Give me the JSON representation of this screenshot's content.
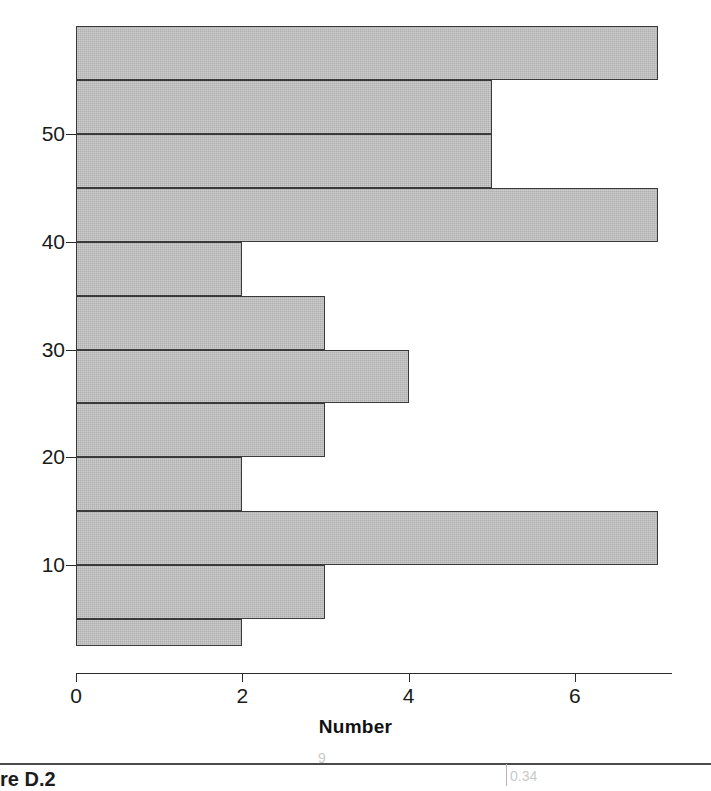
{
  "figure": {
    "caption": "re D.2",
    "bleed_marks": [
      "9",
      "0.34",
      "a"
    ]
  },
  "chart_data": {
    "type": "bar",
    "orientation": "horizontal",
    "title": "",
    "subtitle": "",
    "xlabel": "Number",
    "ylabel": "",
    "xlim": [
      0,
      7
    ],
    "ylim": [
      2.5,
      60
    ],
    "xticks": [
      0,
      2,
      4,
      6
    ],
    "xticklabels": [
      "0",
      "2",
      "4",
      "6"
    ],
    "yticks": [
      10,
      20,
      30,
      40,
      50
    ],
    "yticklabels": [
      "10",
      "20",
      "30",
      "40",
      "50"
    ],
    "grid": false,
    "legend": null,
    "bin_width": 5,
    "bar_color": "#b0b0b0",
    "bar_edge_color": "#3a3a3a",
    "categories": [
      "55-60",
      "50-55",
      "45-50",
      "40-45",
      "35-40",
      "30-35",
      "25-30",
      "20-25",
      "15-20",
      "10-15",
      "5-10",
      "2.5-5"
    ],
    "bins": [
      {
        "lower": 55,
        "upper": 60,
        "value": 7
      },
      {
        "lower": 50,
        "upper": 55,
        "value": 5
      },
      {
        "lower": 45,
        "upper": 50,
        "value": 5
      },
      {
        "lower": 40,
        "upper": 45,
        "value": 7
      },
      {
        "lower": 35,
        "upper": 40,
        "value": 2
      },
      {
        "lower": 30,
        "upper": 35,
        "value": 3
      },
      {
        "lower": 25,
        "upper": 30,
        "value": 4
      },
      {
        "lower": 20,
        "upper": 25,
        "value": 3
      },
      {
        "lower": 15,
        "upper": 20,
        "value": 2
      },
      {
        "lower": 10,
        "upper": 15,
        "value": 7
      },
      {
        "lower": 5,
        "upper": 10,
        "value": 3
      },
      {
        "lower": 2.5,
        "upper": 5,
        "value": 2
      }
    ],
    "values": [
      7,
      5,
      5,
      7,
      2,
      3,
      4,
      3,
      2,
      7,
      3,
      2
    ]
  }
}
